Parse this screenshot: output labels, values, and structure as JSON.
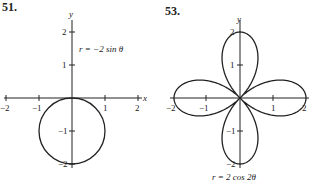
{
  "chart_data": [
    {
      "type": "line",
      "problem_number": "51.",
      "title": "",
      "equation": "r = −2 sin θ",
      "xlabel": "x",
      "ylabel": "y",
      "xlim": [
        -2,
        2
      ],
      "ylim": [
        -2,
        2
      ],
      "x_ticks": [
        "−2",
        "−1",
        "1",
        "2"
      ],
      "y_ticks": [
        "2",
        "1",
        "−1",
        "−2"
      ],
      "curve": "circle centered (0,-1) radius 1"
    },
    {
      "type": "line",
      "problem_number": "53.",
      "title": "",
      "equation": "r = 2 cos 2θ",
      "xlabel": "",
      "ylabel": "y",
      "xlim": [
        -2,
        2
      ],
      "ylim": [
        -2,
        2
      ],
      "x_ticks": [
        "−2",
        "−1",
        "1",
        "2"
      ],
      "y_ticks": [
        "2",
        "1",
        "−1",
        "−2"
      ],
      "curve": "four-petal rose"
    }
  ]
}
